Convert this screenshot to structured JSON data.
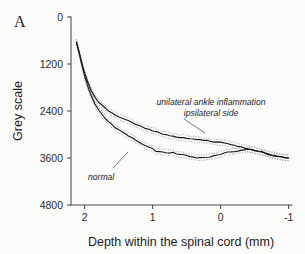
{
  "figure": {
    "panel_label": "A",
    "background_color": "#fbfbfa",
    "curve_color": "#1a1a1a",
    "band_color": "#8d8d8d",
    "axis_color": "#4a4a4a"
  },
  "annotations": {
    "inflammation_line1": "unilateral ankle inflammation",
    "inflammation_line2": "ipsilateral side",
    "normal": "normal"
  },
  "chart_data": {
    "type": "line",
    "title": "",
    "xlabel": "Depth within the spinal cord (mm)",
    "ylabel": "Grey scale",
    "xlim": [
      2.2,
      -1.05
    ],
    "ylim": [
      4800,
      0
    ],
    "y_inverted": true,
    "grid": false,
    "legend": "inline-annotations",
    "xticks": [
      2,
      1,
      0,
      -1
    ],
    "xticklabels": [
      "2",
      "1",
      "0",
      "-1"
    ],
    "yticks": [
      0,
      1200,
      2400,
      3600,
      4800
    ],
    "yticklabels": [
      "0",
      "1200",
      "2400",
      "3600",
      "4800"
    ],
    "series": [
      {
        "name": "unilateral ankle inflammation ipsilateral side",
        "style": "solid",
        "has_error_band": true,
        "x": [
          2.12,
          2.08,
          2.04,
          2.0,
          1.95,
          1.9,
          1.85,
          1.8,
          1.75,
          1.7,
          1.65,
          1.6,
          1.55,
          1.5,
          1.45,
          1.4,
          1.35,
          1.3,
          1.25,
          1.2,
          1.15,
          1.1,
          1.05,
          1.0,
          0.95,
          0.9,
          0.85,
          0.8,
          0.75,
          0.7,
          0.65,
          0.6,
          0.55,
          0.5,
          0.45,
          0.4,
          0.35,
          0.3,
          0.25,
          0.2,
          0.15,
          0.1,
          0.05,
          0.0,
          -0.05,
          -0.1,
          -0.15,
          -0.2,
          -0.25,
          -0.3,
          -0.35,
          -0.4,
          -0.45,
          -0.5,
          -0.55,
          -0.6,
          -0.65,
          -0.7,
          -0.75,
          -0.8,
          -0.85,
          -0.9,
          -0.95,
          -1.0
        ],
        "y": [
          640,
          900,
          1180,
          1430,
          1680,
          1880,
          2040,
          2160,
          2250,
          2320,
          2390,
          2450,
          2500,
          2545,
          2585,
          2625,
          2660,
          2700,
          2740,
          2775,
          2810,
          2845,
          2875,
          2900,
          2930,
          2960,
          2985,
          3010,
          3030,
          3045,
          3065,
          3080,
          3075,
          3095,
          3110,
          3120,
          3130,
          3140,
          3150,
          3160,
          3175,
          3185,
          3195,
          3205,
          3215,
          3230,
          3250,
          3275,
          3300,
          3320,
          3340,
          3360,
          3385,
          3405,
          3430,
          3455,
          3480,
          3505,
          3530,
          3550,
          3565,
          3580,
          3590,
          3600
        ],
        "band_half_width": 70
      },
      {
        "name": "normal",
        "style": "solid",
        "has_error_band": true,
        "x": [
          2.12,
          2.08,
          2.04,
          2.0,
          1.95,
          1.9,
          1.85,
          1.8,
          1.75,
          1.7,
          1.65,
          1.6,
          1.55,
          1.5,
          1.45,
          1.4,
          1.35,
          1.3,
          1.25,
          1.2,
          1.15,
          1.1,
          1.05,
          1.0,
          0.95,
          0.9,
          0.85,
          0.8,
          0.75,
          0.7,
          0.65,
          0.6,
          0.55,
          0.5,
          0.45,
          0.4,
          0.35,
          0.3,
          0.25,
          0.2,
          0.15,
          0.1,
          0.05,
          0.0,
          -0.05,
          -0.1,
          -0.15,
          -0.2,
          -0.25,
          -0.3,
          -0.35,
          -0.4,
          -0.45,
          -0.5,
          -0.55,
          -0.6,
          -0.65,
          -0.7,
          -0.75,
          -0.8,
          -0.85,
          -0.9,
          -0.95,
          -1.0
        ],
        "y": [
          640,
          920,
          1220,
          1500,
          1790,
          2020,
          2210,
          2360,
          2480,
          2580,
          2670,
          2750,
          2820,
          2880,
          2940,
          2990,
          3040,
          3090,
          3140,
          3190,
          3240,
          3290,
          3330,
          3355,
          3430,
          3440,
          3450,
          3455,
          3470,
          3465,
          3500,
          3510,
          3520,
          3545,
          3570,
          3580,
          3590,
          3595,
          3590,
          3580,
          3565,
          3550,
          3530,
          3515,
          3480,
          3455,
          3440,
          3430,
          3415,
          3400,
          3390,
          3385,
          3390,
          3400,
          3420,
          3440,
          3465,
          3490,
          3515,
          3540,
          3560,
          3578,
          3590,
          3600
        ],
        "band_half_width": 72
      }
    ]
  }
}
